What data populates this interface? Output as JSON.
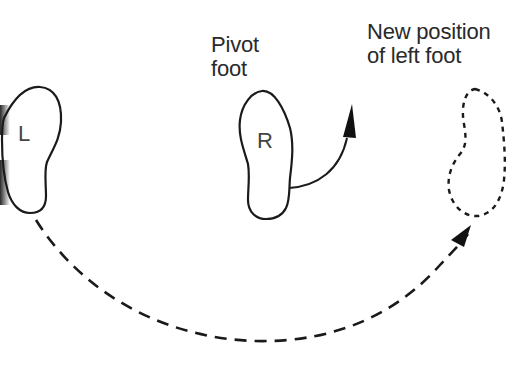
{
  "diagram": {
    "type": "pivot-step-illustration",
    "labels": {
      "pivot_line1": "Pivot",
      "pivot_line2": "foot",
      "new_pos_line1": "New position",
      "new_pos_line2": "of left foot"
    },
    "feet": {
      "left": {
        "letter": "L",
        "style": "solid"
      },
      "right": {
        "letter": "R",
        "style": "solid"
      },
      "new_left": {
        "letter": "",
        "style": "dashed"
      }
    },
    "arrows": [
      {
        "from": "right-foot",
        "to": "up-right",
        "style": "solid"
      },
      {
        "from": "left-foot",
        "to": "new-left-foot",
        "style": "dashed"
      }
    ],
    "colors": {
      "stroke": "#1a1a1a",
      "background": "#ffffff"
    }
  }
}
